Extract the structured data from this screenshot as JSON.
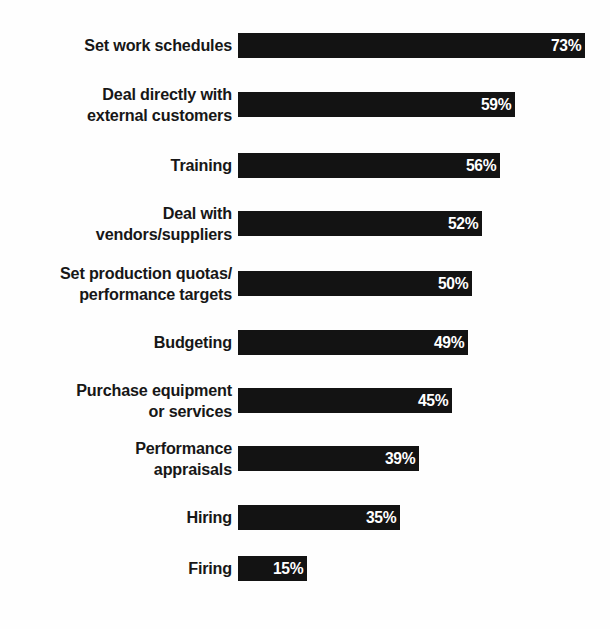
{
  "chart_data": {
    "type": "bar",
    "orientation": "horizontal",
    "title": "",
    "subtitle": "",
    "xlabel": "",
    "ylabel": "",
    "xlim": [
      0,
      100
    ],
    "grid": false,
    "legend": null,
    "value_suffix": "%",
    "bar_color": "#131313",
    "value_label_color": "#ffffff",
    "category_label_color": "#171717",
    "background_color": "#fefefe",
    "categories": [
      "Set work schedules",
      "Deal directly with\nexternal customers",
      "Training",
      "Deal with\nvendors/suppliers",
      "Set production quotas/\nperformance targets",
      "Budgeting",
      "Purchase equipment\nor services",
      "Performance\nappraisals",
      "Hiring",
      "Firing"
    ],
    "values": [
      73,
      59,
      56,
      52,
      50,
      49,
      45,
      39,
      35,
      15
    ],
    "value_labels": [
      "73%",
      "59%",
      "56%",
      "52%",
      "50%",
      "49%",
      "45%",
      "39%",
      "35%",
      "15%"
    ],
    "bars": [
      {
        "label": "Set work schedules",
        "value": 73,
        "value_label": "73%",
        "top": 33,
        "width": 347
      },
      {
        "label": "Deal directly with\nexternal customers",
        "value": 59,
        "value_label": "59%",
        "top": 92,
        "width": 277
      },
      {
        "label": "Training",
        "value": 56,
        "value_label": "56%",
        "top": 153,
        "width": 262
      },
      {
        "label": "Deal with\nvendors/suppliers",
        "value": 52,
        "value_label": "52%",
        "top": 211,
        "width": 244
      },
      {
        "label": "Set production quotas/\nperformance targets",
        "value": 50,
        "value_label": "50%",
        "top": 271,
        "width": 234
      },
      {
        "label": "Budgeting",
        "value": 49,
        "value_label": "49%",
        "top": 330,
        "width": 230
      },
      {
        "label": "Purchase equipment\nor services",
        "value": 45,
        "value_label": "45%",
        "top": 388,
        "width": 214
      },
      {
        "label": "Performance\nappraisals",
        "value": 39,
        "value_label": "39%",
        "top": 446,
        "width": 181
      },
      {
        "label": "Hiring",
        "value": 35,
        "value_label": "35%",
        "top": 505,
        "width": 162
      },
      {
        "label": "Firing",
        "value": 15,
        "value_label": "15%",
        "top": 556,
        "width": 69
      }
    ]
  }
}
